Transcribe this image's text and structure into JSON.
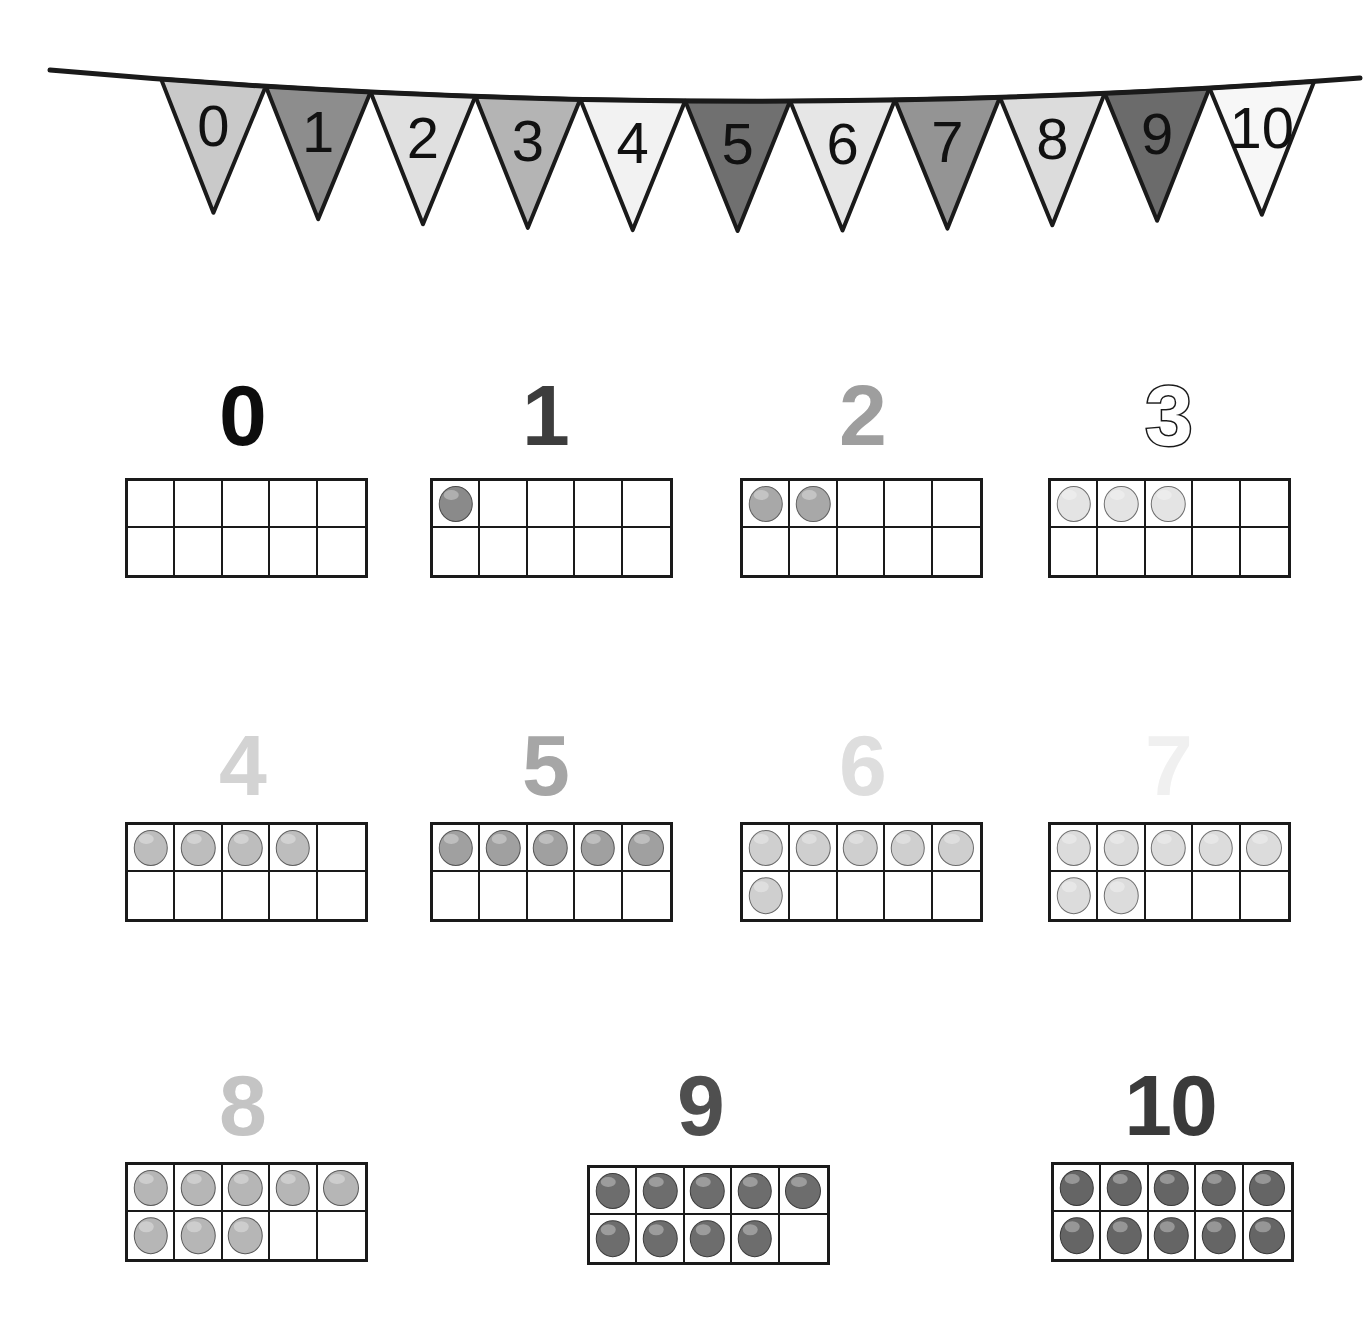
{
  "poster": {
    "title": "Numbers 0 to 10 Ten Frames Poster",
    "background_color": "#ffffff",
    "width": 1368,
    "height": 1326
  },
  "bunting": {
    "name": "number-bunting-banner",
    "string_color": "#1a1a1a",
    "outline_color": "#1a1a1a",
    "flags": [
      {
        "label": "0",
        "fill": "#c9c9c9"
      },
      {
        "label": "1",
        "fill": "#8d8d8d"
      },
      {
        "label": "2",
        "fill": "#e0e0e0"
      },
      {
        "label": "3",
        "fill": "#b4b4b4"
      },
      {
        "label": "4",
        "fill": "#f2f2f2"
      },
      {
        "label": "5",
        "fill": "#707070"
      },
      {
        "label": "6",
        "fill": "#e6e6e6"
      },
      {
        "label": "7",
        "fill": "#949494"
      },
      {
        "label": "8",
        "fill": "#dcdcdc"
      },
      {
        "label": "9",
        "fill": "#6b6b6b"
      },
      {
        "label": "10",
        "fill": "#f7f7f7"
      }
    ]
  },
  "cards": [
    {
      "name": "card-0",
      "numeral": "0",
      "numeral_color": "#0d0d0d",
      "numeral_style": "solid",
      "count": 0,
      "counter_color": "#b0b0b0",
      "counter_border": "#5f5f5f",
      "frame_rows": 2,
      "frame_cols": 5
    },
    {
      "name": "card-1",
      "numeral": "1",
      "numeral_color": "#3d3d3d",
      "numeral_style": "solid",
      "count": 1,
      "counter_color": "#8a8a8a",
      "counter_border": "#4a4a4a",
      "frame_rows": 2,
      "frame_cols": 5
    },
    {
      "name": "card-2",
      "numeral": "2",
      "numeral_color": "#9e9e9e",
      "numeral_style": "solid",
      "count": 2,
      "counter_color": "#a8a8a8",
      "counter_border": "#606060",
      "frame_rows": 2,
      "frame_cols": 5
    },
    {
      "name": "card-3",
      "numeral": "3",
      "numeral_color": "#ffffff",
      "numeral_style": "outlined",
      "count": 3,
      "counter_color": "#e4e4e4",
      "counter_border": "#6e6e6e",
      "frame_rows": 2,
      "frame_cols": 5
    },
    {
      "name": "card-4",
      "numeral": "4",
      "numeral_color": "#d3d3d3",
      "numeral_style": "solid",
      "count": 4,
      "counter_color": "#bdbdbd",
      "counter_border": "#5f5f5f",
      "frame_rows": 2,
      "frame_cols": 5
    },
    {
      "name": "card-5",
      "numeral": "5",
      "numeral_color": "#a6a6a6",
      "numeral_style": "solid",
      "count": 5,
      "counter_color": "#a0a0a0",
      "counter_border": "#555555",
      "frame_rows": 2,
      "frame_cols": 5
    },
    {
      "name": "card-6",
      "numeral": "6",
      "numeral_color": "#dedede",
      "numeral_style": "solid",
      "count": 6,
      "counter_color": "#cfcfcf",
      "counter_border": "#6a6a6a",
      "frame_rows": 2,
      "frame_cols": 5
    },
    {
      "name": "card-7",
      "numeral": "7",
      "numeral_color": "#f0f0f0",
      "numeral_style": "solid",
      "count": 7,
      "counter_color": "#dcdcdc",
      "counter_border": "#707070",
      "frame_rows": 2,
      "frame_cols": 5
    },
    {
      "name": "card-8",
      "numeral": "8",
      "numeral_color": "#c4c4c4",
      "numeral_style": "solid",
      "count": 8,
      "counter_color": "#b6b6b6",
      "counter_border": "#5a5a5a",
      "frame_rows": 2,
      "frame_cols": 5
    },
    {
      "name": "card-9",
      "numeral": "9",
      "numeral_color": "#4f4f4f",
      "numeral_style": "solid",
      "count": 9,
      "counter_color": "#6d6d6d",
      "counter_border": "#3d3d3d",
      "frame_rows": 2,
      "frame_cols": 5
    },
    {
      "name": "card-10",
      "numeral": "10",
      "numeral_color": "#3a3a3a",
      "numeral_style": "solid",
      "count": 10,
      "counter_color": "#656565",
      "counter_border": "#383838",
      "frame_rows": 2,
      "frame_cols": 5
    }
  ]
}
